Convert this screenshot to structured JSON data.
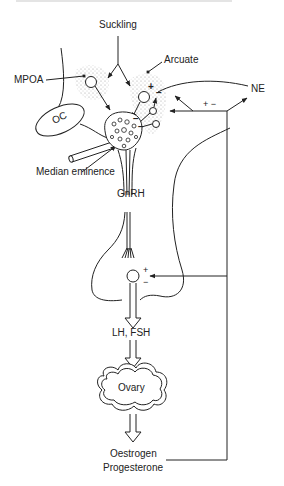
{
  "diagram": {
    "labels": {
      "suckling": "Suckling",
      "arcuate": "Arcuate",
      "mpoa": "MPOA",
      "ne": "NE",
      "oc": "OC",
      "median_eminence": "Median eminence",
      "gnrh": "GnRH",
      "lh_fsh": "LH, FSH",
      "ovary": "Ovary",
      "oestrogen": "Oestrogen",
      "progesterone": "Progesterone"
    },
    "signs": {
      "arcuate_plus": "+",
      "arcuate_minus": "−",
      "ne_plus_minus": "+ −",
      "median_minus_1": "−",
      "median_minus_2": "−",
      "pituitary_plus": "+",
      "pituitary_minus": "−"
    },
    "colors": {
      "line": "#222222",
      "stipple": "#9a9a9a",
      "background": "#ffffff"
    }
  }
}
